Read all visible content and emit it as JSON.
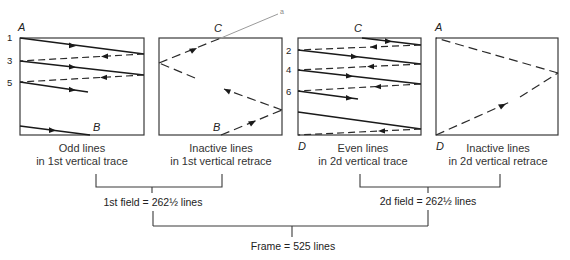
{
  "panels": [
    {
      "id": "odd-trace",
      "caption_line1": "Odd lines",
      "caption_line2": "in 1st vertical trace",
      "corner_labels": {
        "top_left": "A",
        "bottom": "B"
      },
      "line_numbers": [
        "1",
        "3",
        "5"
      ]
    },
    {
      "id": "retrace-1",
      "caption_line1": "Inactive lines",
      "caption_line2": "in 1st vertical retrace",
      "corner_labels": {
        "top": "C",
        "bottom": "B",
        "outside": "a"
      }
    },
    {
      "id": "even-trace",
      "caption_line1": "Even lines",
      "caption_line2": "in 2d vertical trace",
      "corner_labels": {
        "top": "C",
        "bottom_left": "D"
      },
      "line_numbers": [
        "2",
        "4",
        "6"
      ]
    },
    {
      "id": "retrace-2",
      "caption_line1": "Inactive lines",
      "caption_line2": "in 2d vertical retrace",
      "corner_labels": {
        "top_left": "A",
        "bottom_left": "D"
      }
    }
  ],
  "fields": {
    "first": "1st field = 262½ lines",
    "second": "2d field = 262½ lines"
  },
  "frame": "Frame = 525 lines"
}
